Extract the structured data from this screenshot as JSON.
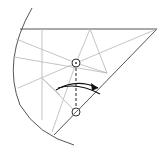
{
  "diagram": {
    "type": "origami-fold-step",
    "colors": {
      "edge": "#555555",
      "crease": "#b5b5b5",
      "fold_line": "#222222",
      "arrow": "#111111",
      "background": "#ffffff"
    },
    "markers": [
      {
        "name": "reference-point-top",
        "cx": 76,
        "cy": 63
      },
      {
        "name": "reference-point-bottom",
        "cx": 76,
        "cy": 112
      }
    ],
    "fold": {
      "kind": "valley-fold",
      "direction": "left-to-right"
    }
  }
}
